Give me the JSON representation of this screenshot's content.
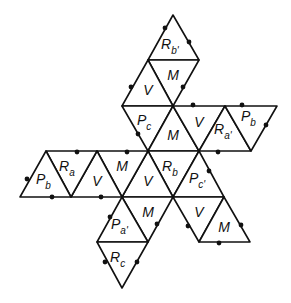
{
  "diagram": {
    "type": "icosahedron-net",
    "stroke_color": "#111111",
    "background": "#ffffff",
    "faces": [
      {
        "id": "f1",
        "label": "R",
        "sub": "b'",
        "pts": [
          [
            173,
            15
          ],
          [
            148,
            60
          ],
          [
            199,
            60
          ]
        ],
        "lx": 167,
        "ly": 49
      },
      {
        "id": "f2",
        "label": "M",
        "sub": "",
        "pts": [
          [
            148,
            60
          ],
          [
            199,
            60
          ],
          [
            173,
            106
          ]
        ],
        "lx": 173,
        "ly": 80
      },
      {
        "id": "f3",
        "label": "V",
        "sub": "",
        "pts": [
          [
            148,
            60
          ],
          [
            122,
            106
          ],
          [
            173,
            106
          ]
        ],
        "lx": 148,
        "ly": 95
      },
      {
        "id": "f4",
        "label": "P",
        "sub": "c",
        "pts": [
          [
            122,
            106
          ],
          [
            173,
            106
          ],
          [
            148,
            151
          ]
        ],
        "lx": 143,
        "ly": 125
      },
      {
        "id": "f5",
        "label": "M",
        "sub": "",
        "pts": [
          [
            173,
            106
          ],
          [
            148,
            151
          ],
          [
            199,
            151
          ]
        ],
        "lx": 173,
        "ly": 140
      },
      {
        "id": "f6",
        "label": "V",
        "sub": "",
        "pts": [
          [
            173,
            106
          ],
          [
            225,
            106
          ],
          [
            199,
            151
          ]
        ],
        "lx": 199,
        "ly": 127
      },
      {
        "id": "f7",
        "label": "R",
        "sub": "a'",
        "pts": [
          [
            225,
            106
          ],
          [
            199,
            151
          ],
          [
            251,
            151
          ]
        ],
        "lx": 220,
        "ly": 134
      },
      {
        "id": "f8",
        "label": "P",
        "sub": "b",
        "pts": [
          [
            225,
            106
          ],
          [
            277,
            106
          ],
          [
            251,
            151
          ]
        ],
        "lx": 247,
        "ly": 121
      },
      {
        "id": "f9",
        "label": "R",
        "sub": "b",
        "pts": [
          [
            148,
            151
          ],
          [
            199,
            151
          ],
          [
            173,
            197
          ]
        ],
        "lx": 168,
        "ly": 171
      },
      {
        "id": "f10",
        "label": "V",
        "sub": "",
        "pts": [
          [
            148,
            151
          ],
          [
            122,
            197
          ],
          [
            173,
            197
          ]
        ],
        "lx": 148,
        "ly": 186
      },
      {
        "id": "f11",
        "label": "M",
        "sub": "",
        "pts": [
          [
            97,
            151
          ],
          [
            148,
            151
          ],
          [
            122,
            197
          ]
        ],
        "lx": 122,
        "ly": 171
      },
      {
        "id": "f12",
        "label": "V",
        "sub": "",
        "pts": [
          [
            97,
            151
          ],
          [
            71,
            197
          ],
          [
            122,
            197
          ]
        ],
        "lx": 97,
        "ly": 186
      },
      {
        "id": "f13",
        "label": "R",
        "sub": "a",
        "pts": [
          [
            46,
            151
          ],
          [
            97,
            151
          ],
          [
            71,
            197
          ]
        ],
        "lx": 65,
        "ly": 171
      },
      {
        "id": "f14",
        "label": "P",
        "sub": "b",
        "pts": [
          [
            46,
            151
          ],
          [
            20,
            197
          ],
          [
            71,
            197
          ]
        ],
        "lx": 42,
        "ly": 184
      },
      {
        "id": "f15",
        "label": "P",
        "sub": "c'",
        "pts": [
          [
            199,
            151
          ],
          [
            173,
            197
          ],
          [
            224,
            197
          ]
        ],
        "lx": 195,
        "ly": 183
      },
      {
        "id": "f16",
        "label": "M",
        "sub": "",
        "pts": [
          [
            122,
            197
          ],
          [
            173,
            197
          ],
          [
            148,
            242
          ]
        ],
        "lx": 148,
        "ly": 217
      },
      {
        "id": "f17",
        "label": "P",
        "sub": "a'",
        "pts": [
          [
            122,
            197
          ],
          [
            97,
            242
          ],
          [
            148,
            242
          ]
        ],
        "lx": 117,
        "ly": 229
      },
      {
        "id": "f18",
        "label": "R",
        "sub": "c",
        "pts": [
          [
            97,
            242
          ],
          [
            148,
            242
          ],
          [
            122,
            288
          ]
        ],
        "lx": 116,
        "ly": 262
      },
      {
        "id": "f19",
        "label": "V",
        "sub": "",
        "pts": [
          [
            173,
            197
          ],
          [
            224,
            197
          ],
          [
            199,
            242
          ]
        ],
        "lx": 199,
        "ly": 217
      },
      {
        "id": "f20",
        "label": "M",
        "sub": "",
        "pts": [
          [
            224,
            197
          ],
          [
            199,
            242
          ],
          [
            250,
            242
          ]
        ],
        "lx": 224,
        "ly": 232
      }
    ],
    "dots": [
      [
        165,
        28
      ],
      [
        189,
        42
      ],
      [
        131,
        87
      ],
      [
        183,
        87
      ],
      [
        193,
        105
      ],
      [
        242,
        105
      ],
      [
        138,
        134
      ],
      [
        266,
        125
      ],
      [
        77,
        152
      ],
      [
        127,
        152
      ],
      [
        218,
        152
      ],
      [
        27,
        179
      ],
      [
        209,
        171
      ],
      [
        52,
        197
      ],
      [
        101,
        197
      ],
      [
        110,
        217
      ],
      [
        157,
        224
      ],
      [
        188,
        226
      ],
      [
        241,
        225
      ],
      [
        219,
        243
      ],
      [
        105,
        262
      ],
      [
        137,
        262
      ]
    ]
  }
}
